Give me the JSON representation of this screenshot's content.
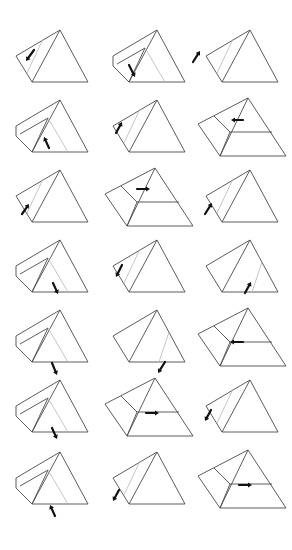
{
  "figure": {
    "rows": 7,
    "cols": 3,
    "colors": {
      "line": "#4a4a4a",
      "faint": "#b8b8b8",
      "arrow": "#111111"
    },
    "panels": [
      {
        "row": 0,
        "col": 0,
        "variant": "side-slab",
        "arrow": {
          "x1": 34,
          "y1": 50,
          "x2": 26,
          "y2": 61,
          "dir": "down-left"
        }
      },
      {
        "row": 0,
        "col": 1,
        "variant": "inner-tri",
        "arrow": {
          "x1": 129,
          "y1": 65,
          "x2": 135,
          "y2": 77,
          "dir": "down-right"
        }
      },
      {
        "row": 0,
        "col": 2,
        "variant": "side-slab",
        "arrow": {
          "x1": 193,
          "y1": 62,
          "x2": 200,
          "y2": 51,
          "dir": "up-right"
        }
      },
      {
        "row": 1,
        "col": 0,
        "variant": "inner-tri",
        "arrow": {
          "x1": 49,
          "y1": 148,
          "x2": 44,
          "y2": 137,
          "dir": "up-left"
        }
      },
      {
        "row": 1,
        "col": 1,
        "variant": "side-slab",
        "arrow": {
          "x1": 116,
          "y1": 133,
          "x2": 122,
          "y2": 122,
          "dir": "up-right"
        }
      },
      {
        "row": 1,
        "col": 2,
        "variant": "layered",
        "arrow": {
          "x1": 243,
          "y1": 120,
          "x2": 231,
          "y2": 120,
          "dir": "left"
        }
      },
      {
        "row": 2,
        "col": 0,
        "variant": "side-slab",
        "arrow": {
          "x1": 22,
          "y1": 214,
          "x2": 29,
          "y2": 204,
          "dir": "up-right"
        }
      },
      {
        "row": 2,
        "col": 1,
        "variant": "layered",
        "arrow": {
          "x1": 137,
          "y1": 189,
          "x2": 150,
          "y2": 189,
          "dir": "right"
        }
      },
      {
        "row": 2,
        "col": 2,
        "variant": "side-slab",
        "arrow": {
          "x1": 205,
          "y1": 214,
          "x2": 212,
          "y2": 203,
          "dir": "up-right"
        }
      },
      {
        "row": 3,
        "col": 0,
        "variant": "inner-tri",
        "arrow": {
          "x1": 53,
          "y1": 283,
          "x2": 58,
          "y2": 294,
          "dir": "down-right"
        }
      },
      {
        "row": 3,
        "col": 1,
        "variant": "side-slab",
        "arrow": {
          "x1": 122,
          "y1": 265,
          "x2": 116,
          "y2": 277,
          "dir": "down-left"
        }
      },
      {
        "row": 3,
        "col": 2,
        "variant": "right-slab",
        "arrow": {
          "x1": 245,
          "y1": 293,
          "x2": 251,
          "y2": 282,
          "dir": "up-right"
        }
      },
      {
        "row": 4,
        "col": 0,
        "variant": "inner-tri",
        "arrow": {
          "x1": 52,
          "y1": 363,
          "x2": 57,
          "y2": 375,
          "dir": "down-right"
        }
      },
      {
        "row": 4,
        "col": 1,
        "variant": "right-slab",
        "arrow": {
          "x1": 165,
          "y1": 362,
          "x2": 158,
          "y2": 373,
          "dir": "down-left"
        }
      },
      {
        "row": 4,
        "col": 2,
        "variant": "layered",
        "arrow": {
          "x1": 243,
          "y1": 342,
          "x2": 230,
          "y2": 342,
          "dir": "left"
        }
      },
      {
        "row": 5,
        "col": 0,
        "variant": "inner-tri",
        "arrow": {
          "x1": 52,
          "y1": 428,
          "x2": 57,
          "y2": 439,
          "dir": "down-right"
        }
      },
      {
        "row": 5,
        "col": 1,
        "variant": "layered",
        "arrow": {
          "x1": 146,
          "y1": 413,
          "x2": 159,
          "y2": 413,
          "dir": "right"
        }
      },
      {
        "row": 5,
        "col": 2,
        "variant": "side-slab",
        "arrow": {
          "x1": 211,
          "y1": 410,
          "x2": 205,
          "y2": 421,
          "dir": "down-left"
        }
      },
      {
        "row": 6,
        "col": 0,
        "variant": "inner-tri",
        "arrow": {
          "x1": 55,
          "y1": 516,
          "x2": 50,
          "y2": 505,
          "dir": "up-left"
        }
      },
      {
        "row": 6,
        "col": 1,
        "variant": "side-slab",
        "arrow": {
          "x1": 119,
          "y1": 490,
          "x2": 113,
          "y2": 501,
          "dir": "down-left"
        }
      },
      {
        "row": 6,
        "col": 2,
        "variant": "layered",
        "arrow": {
          "x1": 239,
          "y1": 485,
          "x2": 252,
          "y2": 485,
          "dir": "right"
        }
      }
    ]
  }
}
